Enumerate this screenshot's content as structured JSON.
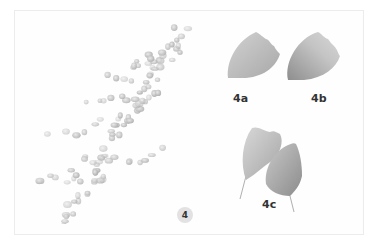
{
  "figure": {
    "main_label": "4",
    "panels": [
      {
        "id": "4a",
        "label": "4a",
        "description": "single leaflet, pale grey wash"
      },
      {
        "id": "4b",
        "label": "4b",
        "description": "single leaflet, graded grey wash"
      },
      {
        "id": "4c",
        "label": "4c",
        "description": "two overlapping leaflets with stems"
      }
    ],
    "colors": {
      "background": "#ffffff",
      "border": "#ececec",
      "leaf_light": "#c9c9c9",
      "leaf_dark": "#8f8f8f",
      "badge_bg": "#e2e2e2",
      "text": "#333333"
    }
  }
}
